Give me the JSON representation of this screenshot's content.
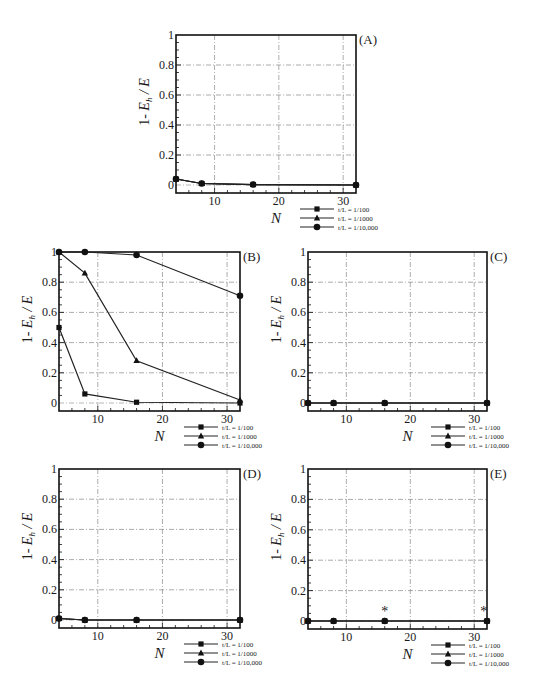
{
  "figure": {
    "y_label_prefix": "1- ",
    "y_label_E": "E",
    "y_label_sub": "h",
    "y_label_suffix": " / E",
    "x_label": "N",
    "legend": [
      "t/L = 1/100",
      "t/L = 1/1000",
      "t/L = 1/10,000"
    ],
    "markers": [
      "square",
      "triangle",
      "diamond"
    ]
  },
  "chart_data": [
    {
      "type": "line",
      "panel": "(A)",
      "xlabel": "N",
      "ylabel": "1- E_h / E",
      "xlim": [
        4,
        32
      ],
      "ylim": [
        0,
        1
      ],
      "xticks": [
        10,
        20,
        30
      ],
      "yticks": [
        0,
        0.2,
        0.4,
        0.6,
        0.8,
        1
      ],
      "grid": true,
      "legend_position": "below-right",
      "x": [
        4,
        8,
        16,
        32
      ],
      "series": [
        {
          "name": "t/L = 1/100",
          "marker": "square",
          "values": [
            0.04,
            0.01,
            0.003,
            0.0
          ]
        },
        {
          "name": "t/L = 1/1000",
          "marker": "triangle",
          "values": [
            0.04,
            0.01,
            0.003,
            0.0
          ]
        },
        {
          "name": "t/L = 1/10,000",
          "marker": "diamond",
          "values": [
            0.04,
            0.01,
            0.003,
            0.0
          ]
        }
      ]
    },
    {
      "type": "line",
      "panel": "(B)",
      "xlabel": "N",
      "ylabel": "1- E_h / E",
      "xlim": [
        4,
        32
      ],
      "ylim": [
        0,
        1
      ],
      "xticks": [
        10,
        20,
        30
      ],
      "yticks": [
        0,
        0.2,
        0.4,
        0.6,
        0.8,
        1
      ],
      "grid": true,
      "legend_position": "below-right",
      "x": [
        4,
        8,
        16,
        32
      ],
      "series": [
        {
          "name": "t/L = 1/100",
          "marker": "square",
          "values": [
            0.5,
            0.06,
            0.005,
            0.0
          ]
        },
        {
          "name": "t/L = 1/1000",
          "marker": "triangle",
          "values": [
            1.0,
            0.86,
            0.28,
            0.02
          ]
        },
        {
          "name": "t/L = 1/10,000",
          "marker": "diamond",
          "values": [
            1.0,
            1.0,
            0.98,
            0.71
          ]
        }
      ]
    },
    {
      "type": "line",
      "panel": "(C)",
      "xlabel": "N",
      "ylabel": "1- E_h / E",
      "xlim": [
        4,
        32
      ],
      "ylim": [
        0,
        1
      ],
      "xticks": [
        10,
        20,
        30
      ],
      "yticks": [
        0,
        0.2,
        0.4,
        0.6,
        0.8,
        1
      ],
      "grid": true,
      "legend_position": "below-right",
      "x": [
        4,
        8,
        16,
        32
      ],
      "series": [
        {
          "name": "t/L = 1/100",
          "marker": "square",
          "values": [
            0.0,
            0.0,
            0.0,
            0.0
          ]
        },
        {
          "name": "t/L = 1/1000",
          "marker": "triangle",
          "values": [
            0.0,
            0.0,
            0.0,
            0.0
          ]
        },
        {
          "name": "t/L = 1/10,000",
          "marker": "diamond",
          "values": [
            0.0,
            0.0,
            0.0,
            0.0
          ]
        }
      ]
    },
    {
      "type": "line",
      "panel": "(D)",
      "xlabel": "N",
      "ylabel": "1- E_h / E",
      "xlim": [
        4,
        32
      ],
      "ylim": [
        0,
        1
      ],
      "xticks": [
        10,
        20,
        30
      ],
      "yticks": [
        0,
        0.2,
        0.4,
        0.6,
        0.8,
        1
      ],
      "grid": true,
      "legend_position": "below-right",
      "x": [
        4,
        8,
        16,
        32
      ],
      "series": [
        {
          "name": "t/L = 1/100",
          "marker": "square",
          "values": [
            0.01,
            0.0,
            0.0,
            0.0
          ]
        },
        {
          "name": "t/L = 1/1000",
          "marker": "triangle",
          "values": [
            0.01,
            0.0,
            0.0,
            0.0
          ]
        },
        {
          "name": "t/L = 1/10,000",
          "marker": "diamond",
          "values": [
            0.01,
            0.0,
            0.0,
            0.0
          ]
        }
      ]
    },
    {
      "type": "line",
      "panel": "(E)",
      "xlabel": "N",
      "ylabel": "1- E_h / E",
      "xlim": [
        4,
        32
      ],
      "ylim": [
        0,
        1
      ],
      "xticks": [
        10,
        20,
        30
      ],
      "yticks": [
        0,
        0.2,
        0.4,
        0.6,
        0.8,
        1
      ],
      "grid": true,
      "legend_position": "below-right",
      "x": [
        4,
        8,
        16,
        32
      ],
      "series": [
        {
          "name": "t/L = 1/100",
          "marker": "square",
          "values": [
            0.0,
            0.0,
            0.0,
            0.0
          ]
        },
        {
          "name": "t/L = 1/1000",
          "marker": "triangle",
          "values": [
            0.0,
            0.0,
            0.0,
            0.0
          ]
        },
        {
          "name": "t/L = 1/10,000",
          "marker": "diamond",
          "values": [
            0.0,
            0.0,
            0.0,
            0.0
          ]
        }
      ],
      "annotations": [
        {
          "text": "*",
          "x": 16,
          "y": 0.06
        },
        {
          "text": "*",
          "x": 31.5,
          "y": 0.06
        }
      ]
    }
  ],
  "layout": {
    "panels": [
      {
        "left": 176,
        "top": 35,
        "right": 356,
        "zero": 185,
        "bottom": 193
      },
      {
        "left": 59,
        "top": 252,
        "right": 240,
        "zero": 403,
        "bottom": 411
      },
      {
        "left": 308,
        "top": 252,
        "right": 487,
        "zero": 403,
        "bottom": 411
      },
      {
        "left": 59,
        "top": 469,
        "right": 240,
        "zero": 620,
        "bottom": 628
      },
      {
        "left": 308,
        "top": 469,
        "right": 487,
        "zero": 621,
        "bottom": 629
      }
    ]
  }
}
